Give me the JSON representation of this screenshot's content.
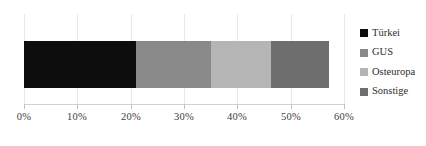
{
  "chart_data": {
    "type": "bar",
    "orientation": "horizontal",
    "stacked": true,
    "title": "",
    "subtitle": "",
    "xlabel": "",
    "ylabel": "",
    "categories": [
      ""
    ],
    "xlim": [
      0,
      60
    ],
    "xtick_labels": [
      "0%",
      "10%",
      "20%",
      "30%",
      "40%",
      "50%",
      "60%"
    ],
    "xtick_values": [
      0,
      10,
      20,
      30,
      40,
      50,
      60
    ],
    "grid": true,
    "grid_axis": "x",
    "legend_position": "right",
    "total": 57.2,
    "series": [
      {
        "name": "Türkei",
        "values": [
          21.0
        ],
        "color": "#0d0d0d"
      },
      {
        "name": "GUS",
        "values": [
          14.1
        ],
        "color": "#898989"
      },
      {
        "name": "Osteuropa",
        "values": [
          11.3
        ],
        "color": "#b5b5b5"
      },
      {
        "name": "Sonstige",
        "values": [
          10.8
        ],
        "color": "#6e6e6e"
      }
    ]
  },
  "legend": {
    "items": [
      {
        "label": "Türkei",
        "swatch_color": "#0d0d0d",
        "swatch_icon": "legend-swatch-square"
      },
      {
        "label": "GUS",
        "swatch_color": "#898989",
        "swatch_icon": "legend-swatch-square"
      },
      {
        "label": "Osteuropa",
        "swatch_color": "#b5b5b5",
        "swatch_icon": "legend-swatch-square"
      },
      {
        "label": "Sonstige",
        "swatch_color": "#6e6e6e",
        "swatch_icon": "legend-swatch-square"
      }
    ]
  },
  "colors": {
    "background": "#ffffff",
    "gridline": "#e8e8ea",
    "axis": "#d0d0d4",
    "tick": "#bfbfc3",
    "label_text": "#3c3c3c",
    "legend_text": "#2d2d2d"
  }
}
